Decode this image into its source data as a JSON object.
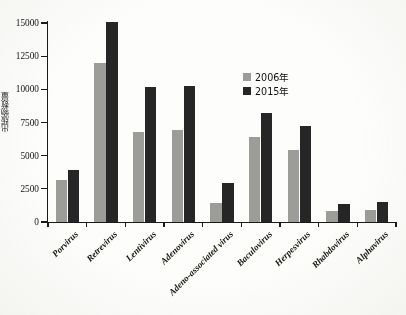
{
  "chart_data": {
    "type": "bar",
    "title": "",
    "xlabel": "",
    "ylabel": "出版物数量",
    "ylim": [
      0,
      15000
    ],
    "yticks": [
      0,
      2500,
      5000,
      7500,
      10000,
      12500,
      15000
    ],
    "ytick_labels": [
      "0",
      "2500",
      "5000",
      "7500",
      "10000",
      "12500",
      "15000"
    ],
    "grid": false,
    "legend_position": "upper-right-inside",
    "categories": [
      "Porvirus",
      "Retrevirus",
      "Lentivirus",
      "Adenovirus",
      "Adeno-associated virus",
      "Baculovirus",
      "Herpesvirus",
      "Rhabdovirus",
      "Alphavirus"
    ],
    "series": [
      {
        "name": "2006年",
        "color": "#9c9c99",
        "values": [
          3150,
          12000,
          6800,
          6900,
          1400,
          6400,
          5400,
          800,
          900
        ]
      },
      {
        "name": "2015年",
        "color": "#262626",
        "values": [
          3900,
          15100,
          10150,
          10250,
          2950,
          8250,
          7200,
          1350,
          1500
        ]
      }
    ]
  },
  "legend": {
    "items": [
      {
        "label": "2006年",
        "color": "#9c9c99"
      },
      {
        "label": "2015年",
        "color": "#262626"
      }
    ]
  },
  "axes": {
    "y_title": "出版物数量"
  }
}
